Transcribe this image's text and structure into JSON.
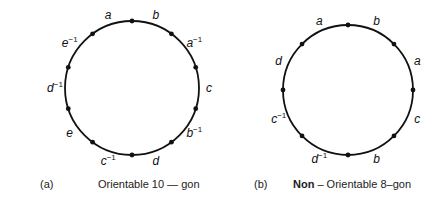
{
  "figures": [
    {
      "id": "a",
      "tag": "(a)",
      "caption": "Orientable 10 — gon",
      "center": [
        132,
        88
      ],
      "radius": 67,
      "vertex_count": 10,
      "edges": [
        {
          "label": "a",
          "exp": ""
        },
        {
          "label": "b",
          "exp": ""
        },
        {
          "label": "a",
          "exp": "−1"
        },
        {
          "label": "c",
          "exp": ""
        },
        {
          "label": "b",
          "exp": "−1"
        },
        {
          "label": "d",
          "exp": ""
        },
        {
          "label": "c",
          "exp": "−1"
        },
        {
          "label": "e",
          "exp": ""
        },
        {
          "label": "d",
          "exp": "−1"
        },
        {
          "label": "e",
          "exp": "−1"
        }
      ]
    },
    {
      "id": "b",
      "tag": "(b)",
      "caption_bold": "Non",
      "caption_rest": " – Orientable 8–gon",
      "center": [
        348,
        90
      ],
      "radius": 65,
      "vertex_count": 8,
      "edges": [
        {
          "label": "a",
          "exp": ""
        },
        {
          "label": "b",
          "exp": ""
        },
        {
          "label": "a",
          "exp": ""
        },
        {
          "label": "c",
          "exp": ""
        },
        {
          "label": "b",
          "exp": ""
        },
        {
          "label": "d",
          "exp": "−1"
        },
        {
          "label": "c",
          "exp": "−1"
        },
        {
          "label": "d",
          "exp": ""
        }
      ]
    }
  ],
  "colors": {
    "ink": "#111111",
    "background": "#ffffff"
  }
}
